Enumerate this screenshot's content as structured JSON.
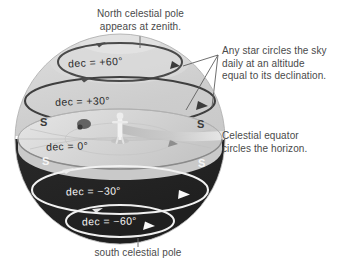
{
  "figure": {
    "title_alt": "Celestial sphere as seen from the North Pole",
    "captions": {
      "top": "North celestial pole\nappears at zenith.",
      "right_top": "Any star circles the sky\ndaily at an altitude\nequal to its declination.",
      "right_mid": "Celestial equator\ncircles the horizon.",
      "bottom": "south celestial pole"
    },
    "rings": [
      {
        "id": "dec_plus_60",
        "label": "dec = +60°",
        "declination": 60,
        "tone": "dark"
      },
      {
        "id": "dec_plus_30",
        "label": "dec = +30°",
        "declination": 30,
        "tone": "dark"
      },
      {
        "id": "dec_zero",
        "label": "dec = 0°",
        "declination": 0,
        "tone": "dark"
      },
      {
        "id": "dec_minus_30",
        "label": "dec = −30°",
        "declination": -30,
        "tone": "light"
      },
      {
        "id": "dec_minus_60",
        "label": "dec = −60°",
        "declination": -60,
        "tone": "light"
      }
    ],
    "markers": [
      {
        "id": "s_left_top",
        "label": "S",
        "tone": "dark"
      },
      {
        "id": "s_right_top",
        "label": "S",
        "tone": "dark"
      },
      {
        "id": "s_left_bot",
        "label": "S",
        "tone": "light"
      },
      {
        "id": "s_right_bot",
        "label": "S",
        "tone": "light"
      }
    ],
    "colors": {
      "upper_hemisphere": "#cfcfcf",
      "upper_hemisphere_light": "#e3e3e3",
      "lower_hemisphere": "#2b2b2b",
      "horizon_disk": "#d9d9d9",
      "horizon_disk_edge": "#bdbdbd",
      "ring_dark": "#3b3b3b",
      "ring_light": "#f4f4f4",
      "caption_text": "#4a4a4a",
      "leader_line": "#6b6b6b",
      "background": "#ffffff",
      "observer": "#f0f0f0"
    }
  }
}
